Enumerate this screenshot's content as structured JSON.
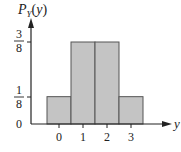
{
  "chart_data": {
    "type": "bar",
    "title": "",
    "ylabel": "P_Y(y)",
    "ylabel_display": {
      "main": "P",
      "sub": "Y",
      "arg": "(y)"
    },
    "xlabel": "y",
    "categories": [
      "0",
      "1",
      "2",
      "3"
    ],
    "values": [
      0.125,
      0.375,
      0.375,
      0.125
    ],
    "value_labels": [
      "1/8",
      "3/8",
      "3/8",
      "1/8"
    ],
    "y_ticks": [
      {
        "value": 0,
        "label": "0"
      },
      {
        "value": 0.125,
        "label": "1/8",
        "num": "1",
        "den": "8"
      },
      {
        "value": 0.375,
        "label": "3/8",
        "num": "3",
        "den": "8"
      }
    ],
    "x_ticks": [
      "0",
      "1",
      "2",
      "3"
    ],
    "ylim": [
      0,
      0.45
    ],
    "grid": false,
    "legend": null,
    "bar_color": "#c4c4c4",
    "bar_edge_color": "#555555",
    "axis_color": "#222222"
  }
}
